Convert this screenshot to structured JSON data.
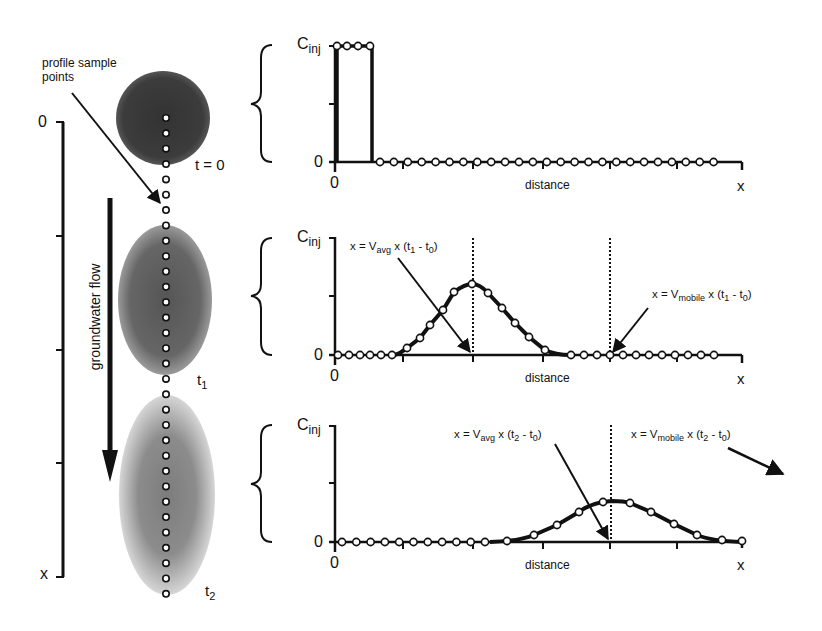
{
  "left_panel": {
    "sample_label": "profile sample points",
    "flow_label": "groundwater flow",
    "depth_axis": {
      "top_label": "0",
      "bottom_label": "x"
    },
    "plumes": [
      {
        "time_label": "t = 0",
        "time_main": "t = 0",
        "time_sub": ""
      },
      {
        "time_label": "t1",
        "time_main": "t",
        "time_sub": "1"
      },
      {
        "time_label": "t2",
        "time_main": "t",
        "time_sub": "2"
      }
    ]
  },
  "plots": [
    {
      "y_top_label": "C",
      "y_top_sub": "inj",
      "y_zero_label": "0",
      "x_zero_label": "0",
      "x_axis_label": "distance",
      "x_end_label": "x",
      "annotations": []
    },
    {
      "y_top_label": "C",
      "y_top_sub": "inj",
      "y_zero_label": "0",
      "x_zero_label": "0",
      "x_axis_label": "distance",
      "x_end_label": "x",
      "annotations": [
        {
          "pre": "x = V",
          "sub": "avg",
          "mid": " x (t",
          "sub2": "1",
          "dash": " - t",
          "sub3": "0",
          "post": ")"
        },
        {
          "pre": "x = V",
          "sub": "mobile",
          "mid": " x (t",
          "sub2": "1",
          "dash": " - t",
          "sub3": "0",
          "post": ")"
        }
      ]
    },
    {
      "y_top_label": "C",
      "y_top_sub": "inj",
      "y_zero_label": "0",
      "x_zero_label": "0",
      "x_axis_label": "distance",
      "x_end_label": "x",
      "annotations": [
        {
          "pre": "x = V",
          "sub": "avg",
          "mid": " x (t",
          "sub2": "2",
          "dash": " - t",
          "sub3": "0",
          "post": ")"
        },
        {
          "pre": "x = V",
          "sub": "mobile",
          "mid": " x (t",
          "sub2": "2",
          "dash": " - t",
          "sub3": "0",
          "post": ")"
        }
      ]
    }
  ],
  "colors": {
    "ink": "#111111",
    "plume_t0": "#3a3a3a",
    "plume_t1": "#5e5e5e",
    "plume_t2": "#8a8a8a",
    "background": "#ffffff"
  }
}
